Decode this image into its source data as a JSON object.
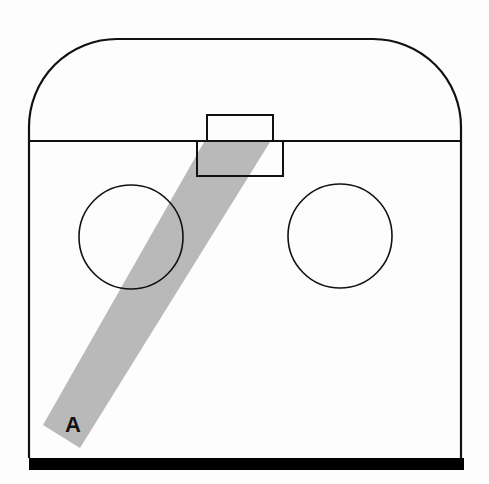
{
  "diagram": {
    "type": "schematic top-down view",
    "colors": {
      "outline": "#111111",
      "band": "#b9b9b9",
      "floor": "#000000",
      "background": "#fdfdfd"
    },
    "shapes": {
      "outer_enclosure": {
        "left": 29,
        "right": 461,
        "top": 39,
        "bottom": 458,
        "corner_radius": 88
      },
      "divider_line": {
        "y": 141
      },
      "upper_box": {
        "x": 207,
        "y": 115,
        "w": 66,
        "h": 26
      },
      "lower_box": {
        "x": 197,
        "y": 141,
        "w": 86,
        "h": 35
      },
      "left_circle": {
        "cx": 131,
        "cy": 237,
        "r": 52
      },
      "right_circle": {
        "cx": 340,
        "cy": 236,
        "r": 52
      },
      "floor_bar": {
        "x": 29,
        "y": 458,
        "w": 435,
        "h": 12
      },
      "band": {
        "points": "204,142 270,142 80,448 43,425"
      }
    },
    "labels": [
      {
        "id": "band-label",
        "text": "A",
        "x": 66,
        "y": 432
      }
    ]
  }
}
